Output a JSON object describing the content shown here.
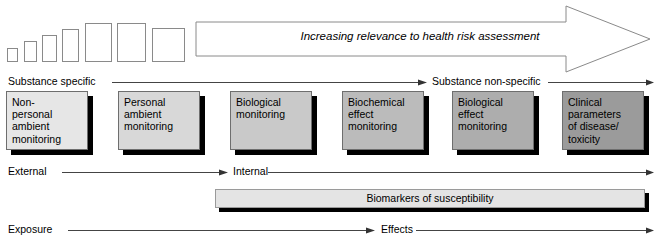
{
  "figure": {
    "top_arrow": {
      "label": "Increasing relevance to health risk assessment",
      "style": "outlined-right-arrow"
    },
    "steps": {
      "count": 8,
      "description": "increasing-size-rectangles"
    },
    "axes": [
      {
        "name": "specificity",
        "left_label": "Substance specific",
        "right_label": "Substance non-specific"
      },
      {
        "name": "compartment",
        "left_label": "External",
        "right_label": "Internal"
      },
      {
        "name": "exposure-effect",
        "left_label": "Exposure",
        "right_label": "Effects"
      }
    ],
    "boxes": [
      {
        "label": "Non-\npersonal\nambient\nmonitoring",
        "fill": "#e6e6e6"
      },
      {
        "label": "Personal\nambient\nmonitoring",
        "fill": "#d8d8d8"
      },
      {
        "label": "Biological\nmonitoring",
        "fill": "#c9c9c9"
      },
      {
        "label": "Biochemical\neffect\nmonitoring",
        "fill": "#bbbbbb"
      },
      {
        "label": "Biological\neffect\nmonitoring",
        "fill": "#adadad"
      },
      {
        "label": "Clinical\nparameters\nof disease/\ntoxicity",
        "fill": "#9b9b9b"
      }
    ],
    "susceptibility_bar": {
      "label": "Biomarkers of susceptibility",
      "fill": "#e4e4e4"
    },
    "colors": {
      "outline": "#8a8a8a",
      "box_outline": "#6e6e6e",
      "shadow": "#000000",
      "text": "#000000",
      "background": "#ffffff"
    }
  }
}
